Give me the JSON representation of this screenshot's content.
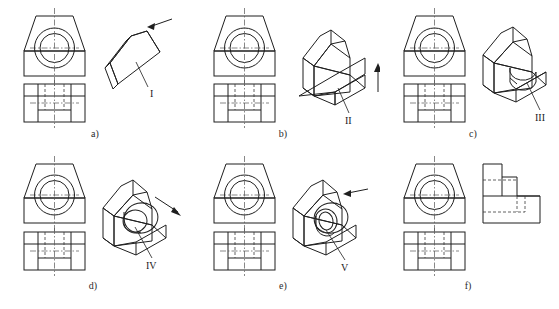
{
  "figure": {
    "background_color": "#ffffff",
    "line_color": "#1f1f1f",
    "hidden_line_color": "#3a3a3a",
    "center_line_color": "#555555"
  },
  "panels": [
    {
      "id": "a",
      "caption": "a)",
      "feature_label": "I",
      "views": [
        "front-view",
        "top-view",
        "isometric-pictorial"
      ],
      "pictorial": "wedge-prism",
      "has_arrow": true,
      "arrow_direction": "upper-right"
    },
    {
      "id": "b",
      "caption": "b)",
      "feature_label": "II",
      "views": [
        "front-view",
        "top-view",
        "isometric-pictorial"
      ],
      "pictorial": "ramp-block",
      "has_arrow": true,
      "arrow_direction": "up"
    },
    {
      "id": "c",
      "caption": "c)",
      "feature_label": "III",
      "views": [
        "front-view",
        "top-view",
        "isometric-pictorial"
      ],
      "pictorial": "block-with-round-slot",
      "has_arrow": false,
      "arrow_direction": ""
    },
    {
      "id": "d",
      "caption": "d)",
      "feature_label": "IV",
      "views": [
        "front-view",
        "top-view",
        "isometric-pictorial"
      ],
      "pictorial": "block-with-cylindrical-boss",
      "has_arrow": true,
      "arrow_direction": "lower-right"
    },
    {
      "id": "e",
      "caption": "e)",
      "feature_label": "V",
      "views": [
        "front-view",
        "top-view",
        "isometric-pictorial"
      ],
      "pictorial": "block-with-bored-boss",
      "has_arrow": true,
      "arrow_direction": "upper-right"
    },
    {
      "id": "f",
      "caption": "f)",
      "feature_label": "",
      "views": [
        "front-view",
        "top-view",
        "right-side-view"
      ],
      "pictorial": "stepped-profile",
      "has_arrow": false,
      "arrow_direction": ""
    }
  ]
}
